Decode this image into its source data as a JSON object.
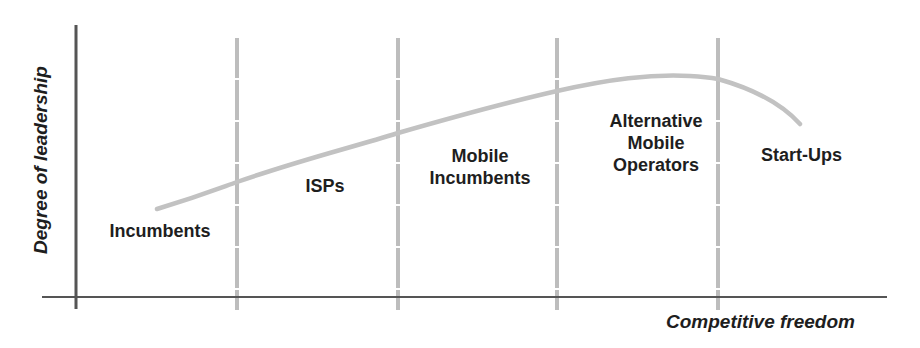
{
  "diagram": {
    "axes": {
      "y_label": "Degree of leadership",
      "x_label": "Competitive freedom"
    },
    "segments": [
      {
        "id": "incumbents",
        "label": "Incumbents"
      },
      {
        "id": "isps",
        "label": "ISPs"
      },
      {
        "id": "mobile-incumbents",
        "label": "Mobile\nIncumbents"
      },
      {
        "id": "alternative-mobile-operators",
        "label": "Alternative\nMobile\nOperators"
      },
      {
        "id": "start-ups",
        "label": "Start-Ups"
      }
    ],
    "divider_count": 4,
    "curve": {
      "description": "Leadership rises with competitive freedom, peaks among Alternative Mobile Operators, then declines for Start-Ups",
      "color": "#c2c2c2"
    },
    "colors": {
      "axis": "#555555",
      "divider": "#bdbdbd",
      "text": "#1e1e1e",
      "background": "#ffffff"
    }
  }
}
